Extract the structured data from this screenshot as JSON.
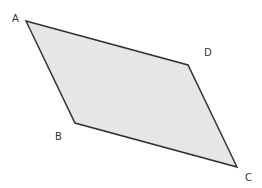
{
  "diagram": {
    "shape": "parallelogram",
    "fill": "#e6e6e6",
    "stroke": "#333333",
    "vertices": [
      {
        "label": "A",
        "x": 26,
        "y": 21,
        "lx": 12,
        "ly": 22
      },
      {
        "label": "D",
        "x": 188,
        "y": 65,
        "lx": 204,
        "ly": 56
      },
      {
        "label": "C",
        "x": 237,
        "y": 167,
        "lx": 245,
        "ly": 181
      },
      {
        "label": "B",
        "x": 75,
        "y": 123,
        "lx": 55,
        "ly": 140
      }
    ]
  }
}
